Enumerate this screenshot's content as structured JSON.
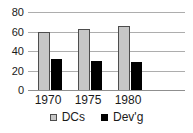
{
  "chart_data": {
    "type": "bar",
    "categories": [
      "1970",
      "1975",
      "1980"
    ],
    "series": [
      {
        "name": "DCs",
        "color": "#c6c6c6",
        "border_color": "#4d4d4d",
        "values": [
          60,
          63,
          66
        ]
      },
      {
        "name": "Dev'g",
        "color": "#000000",
        "border_color": "#000000",
        "values": [
          32,
          30,
          29
        ]
      }
    ],
    "title": "",
    "xlabel": "",
    "ylabel": "",
    "ylim": [
      0,
      80
    ],
    "yticks": [
      0,
      20,
      40,
      60,
      80
    ],
    "grid": true,
    "legend_position": "bottom"
  },
  "colors": {
    "background": "#ffffff",
    "gridline": "#adadad",
    "baseline": "#8f8f8f",
    "text": "#1a1a1a"
  },
  "layout_hints": {
    "group_centers_px": [
      48,
      88,
      128
    ],
    "bar_width_px": 12
  }
}
